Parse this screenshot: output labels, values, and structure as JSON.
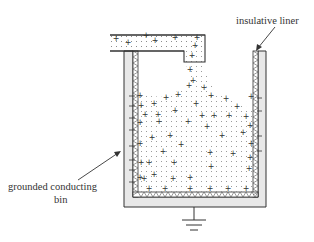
{
  "diagram": {
    "labels": {
      "liner": "insulative liner",
      "bin_line1": "grounded conducting",
      "bin_line2": "bin"
    },
    "components": [
      {
        "id": "feed-spout",
        "name": "feed spout with charged powder"
      },
      {
        "id": "powder-stream",
        "name": "falling powder stream"
      },
      {
        "id": "powder-heap",
        "name": "positively charged powder heap"
      },
      {
        "id": "insulative-liner",
        "name": "insulative liner"
      },
      {
        "id": "conducting-bin",
        "name": "grounded conducting bin"
      },
      {
        "id": "ground",
        "name": "ground symbol"
      }
    ],
    "charges": {
      "powder": "+",
      "bin_wall": "-"
    },
    "colors": {
      "outline": "#333333",
      "bin_fill": "#e8e8e8",
      "dot": "#8a8a8a"
    }
  }
}
